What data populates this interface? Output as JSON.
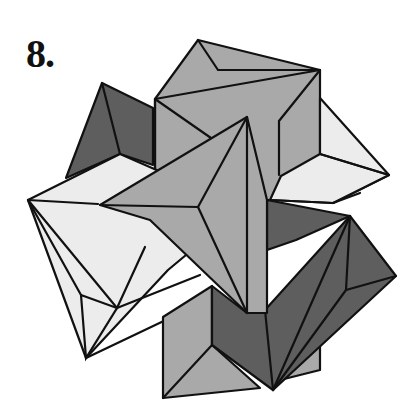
{
  "figure": {
    "label": "8.",
    "colors": {
      "background": "#ffffff",
      "outline": "#111111",
      "light": "#ececec",
      "mid": "#a9a9a9",
      "dark": "#5e5e5e"
    }
  }
}
